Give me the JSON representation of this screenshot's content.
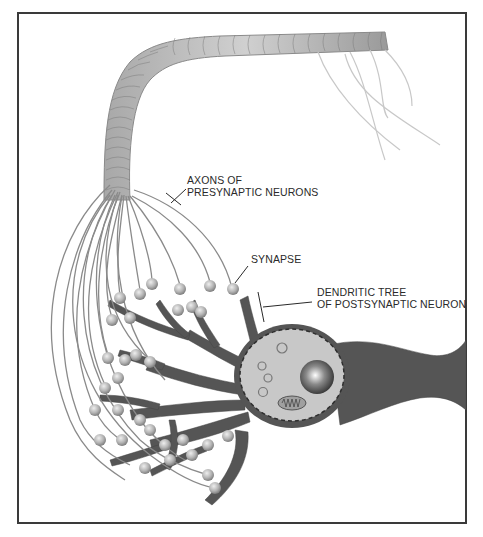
{
  "figure": {
    "type": "neuron-synapse-diagram",
    "labels": {
      "axons": {
        "line1": "AXONS OF",
        "line2": "PRESYNAPTIC NEURONS"
      },
      "synapse": {
        "line1": "SYNAPSE"
      },
      "dendritic_tree": {
        "line1": "DENDRITIC TREE",
        "line2": "OF POSTSYNAPTIC NEURON"
      }
    },
    "colors": {
      "frame": "#3a3a3a",
      "dendrite": "#555555",
      "cell_body_fill": "#c8c8c8",
      "axon_stroke": "#8a8a8a",
      "axon_bundle": "#b5b5b5",
      "bouton": "#b0b0b0",
      "label_text": "#2a2a2a"
    }
  }
}
